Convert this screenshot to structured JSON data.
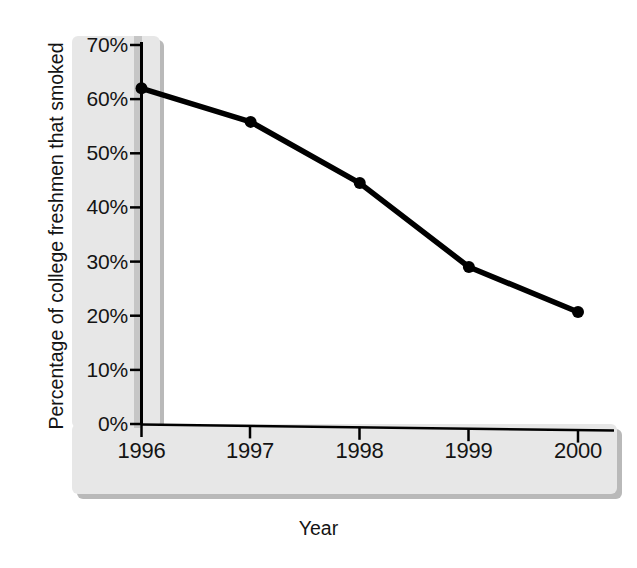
{
  "chart_data": {
    "type": "line",
    "title": "",
    "xlabel": "Year",
    "ylabel": "Percentage of college freshmen that smoked",
    "categories": [
      "1996",
      "1997",
      "1998",
      "1999",
      "2000"
    ],
    "x": [
      1996,
      1997,
      1998,
      1999,
      2000
    ],
    "values": [
      62,
      55.8,
      44.5,
      29,
      20.7
    ],
    "series": [
      {
        "name": "Percentage of college freshmen that smoked",
        "values": [
          62,
          55.8,
          44.5,
          29,
          20.7
        ]
      }
    ],
    "ylim": [
      0,
      70
    ],
    "xlim": [
      1996,
      2000
    ],
    "ytick_labels": [
      "0%",
      "10%",
      "20%",
      "30%",
      "40%",
      "50%",
      "60%",
      "70%"
    ],
    "ytick_values": [
      0,
      10,
      20,
      30,
      40,
      50,
      60,
      70
    ],
    "xtick_labels": [
      "1996",
      "1997",
      "1998",
      "1999",
      "2000"
    ],
    "grid": false,
    "legend": false,
    "legend_position": "none",
    "marker": "filled-circle",
    "line_color": "#000000",
    "marker_color": "#000000",
    "panel_color": "#e7e7e7",
    "axis_color": "#000000"
  },
  "figure": {
    "caption_remnant": ""
  }
}
